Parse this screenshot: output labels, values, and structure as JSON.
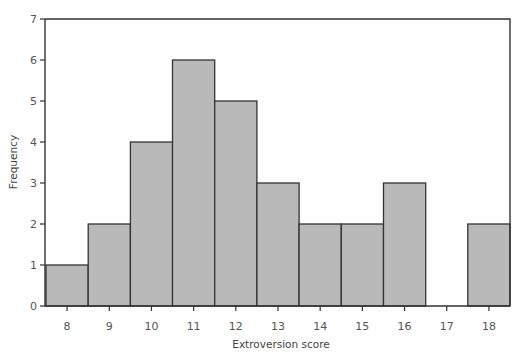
{
  "chart_data": {
    "type": "bar",
    "subtype": "histogram",
    "title": "",
    "xlabel": "Extroversion score",
    "ylabel": "Frequency",
    "categories": [
      "8",
      "9",
      "10",
      "11",
      "12",
      "13",
      "14",
      "15",
      "16",
      "17",
      "18"
    ],
    "values": [
      1,
      2,
      4,
      6,
      5,
      3,
      2,
      2,
      3,
      0,
      2
    ],
    "ylim": [
      0,
      7
    ],
    "yticks": [
      0,
      1,
      2,
      3,
      4,
      5,
      6,
      7
    ],
    "grid": false,
    "legend": null,
    "bar_color": "#b9b9b9",
    "edge_color": "#333333"
  }
}
